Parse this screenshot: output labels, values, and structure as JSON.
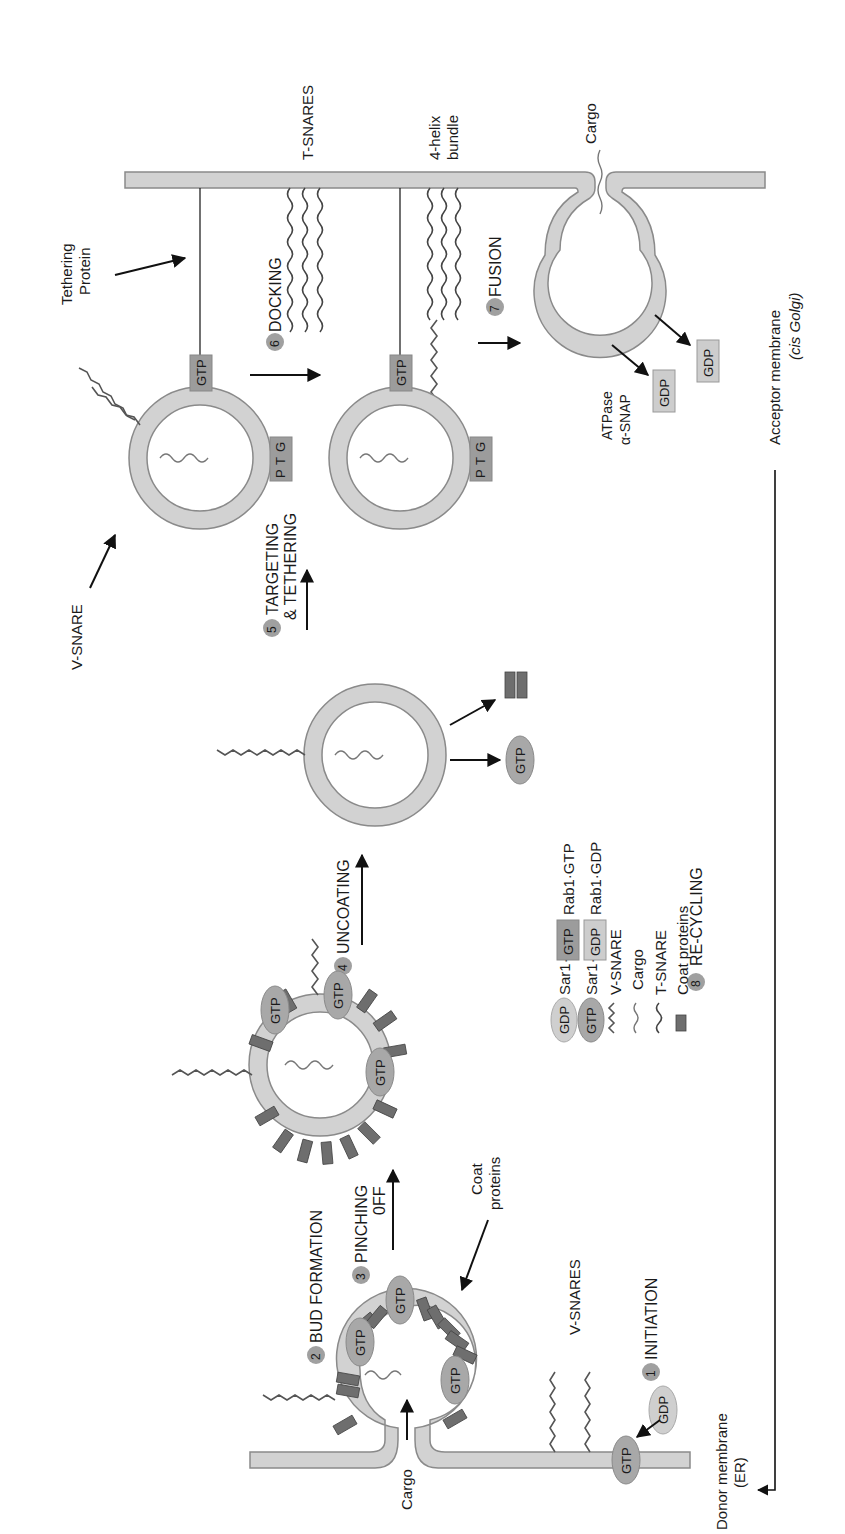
{
  "figure": {
    "orientation": "rotated 90° counter-clockwise"
  },
  "steps": [
    {
      "num": "1",
      "label": "INITIATION"
    },
    {
      "num": "2",
      "label": "BUD FORMATION"
    },
    {
      "num": "3",
      "label": "PINCHING",
      "label2": "0FF"
    },
    {
      "num": "4",
      "label": "UNCOATING"
    },
    {
      "num": "5",
      "label": "TARGETING",
      "label2": "& TETHERING"
    },
    {
      "num": "6",
      "label": "DOCKING"
    },
    {
      "num": "7",
      "label": "FUSION"
    },
    {
      "num": "8",
      "label": "RE-CYCLING"
    }
  ],
  "labels": {
    "donor_membrane": "Donor membrane",
    "donor_membrane_abbr": "(ER)",
    "acceptor_membrane": "Acceptor membrane",
    "acceptor_membrane_abbr": "(cis Golgi)",
    "cargo_bottom": "Cargo",
    "cargo_top": "Cargo",
    "v_snares": "V-SNARES",
    "v_snare": "V-SNARE",
    "t_snares": "T-SNARES",
    "coat_proteins_1": "Coat",
    "coat_proteins_2": "proteins",
    "tethering_1": "Tethering",
    "tethering_2": "Protein",
    "helix_1": "4-helix",
    "helix_2": "bundle",
    "atpase": "ATPase",
    "alpha_snap": "α-SNAP"
  },
  "badges": {
    "gtp": "GTP",
    "gdp": "GDP",
    "g": "G",
    "t": "T",
    "p": "P"
  },
  "legend": [
    {
      "symbol": "GDP",
      "type": "sar-oval-light",
      "text": "Sar1·GDP"
    },
    {
      "symbol": "GTP",
      "type": "sar-oval-dark",
      "text": "Sar1·GTP"
    },
    {
      "symbol": "zigzag",
      "type": "v-snare",
      "text": "V-SNARE"
    },
    {
      "symbol": "wave",
      "type": "cargo",
      "text": "Cargo"
    },
    {
      "symbol": "wave-dark",
      "type": "t-snare",
      "text": "T-SNARE"
    },
    {
      "symbol": "bar",
      "type": "coat",
      "text": "Coat proteins"
    },
    {
      "symbol": "GTP",
      "type": "rab-box-dark",
      "text": "Rab1·GTP"
    },
    {
      "symbol": "GDP",
      "type": "rab-box-light",
      "text": "Rab1·GDP"
    }
  ]
}
